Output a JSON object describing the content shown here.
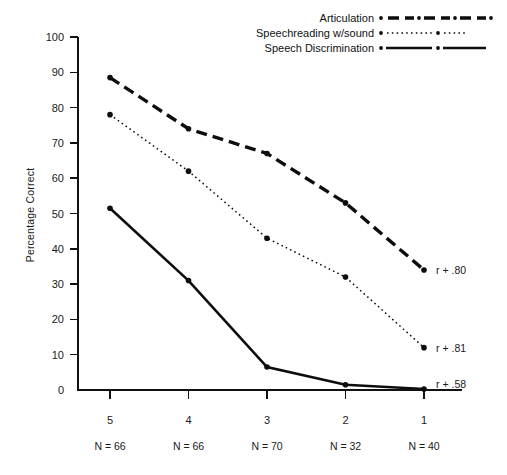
{
  "chart_data": {
    "type": "line",
    "title": "",
    "xlabel": "",
    "ylabel": "Percentage Correct",
    "categories": [
      "5",
      "4",
      "3",
      "2",
      "1"
    ],
    "category_sublabels": [
      "N = 66",
      "N = 66",
      "N = 70",
      "N = 32",
      "N = 40"
    ],
    "xlim": [
      5,
      1
    ],
    "ylim": [
      0,
      100
    ],
    "ytick_labels": [
      "0",
      "10",
      "20",
      "30",
      "40",
      "50",
      "60",
      "70",
      "80",
      "90",
      "100"
    ],
    "ytick_values": [
      0,
      10,
      20,
      30,
      40,
      50,
      60,
      70,
      80,
      90,
      100
    ],
    "grid": false,
    "legend_position": "top-right",
    "series": [
      {
        "name": "Articulation",
        "style": "dashed-thick",
        "values": [
          88.5,
          74,
          67,
          53,
          34
        ],
        "annotation": "r + .80"
      },
      {
        "name": "Speechreading w/sound",
        "style": "dotted",
        "values": [
          78,
          62,
          43,
          32,
          12
        ],
        "annotation": "r + .81"
      },
      {
        "name": "Speech Discrimination",
        "style": "solid",
        "values": [
          51.5,
          31,
          6.5,
          1.5,
          0.3
        ],
        "annotation": "r + .58"
      }
    ],
    "annotations": [
      {
        "text": "r + .80",
        "series": "Articulation"
      },
      {
        "text": "r + .81",
        "series": "Speechreading w/sound"
      },
      {
        "text": "r + .58",
        "series": "Speech Discrimination"
      }
    ],
    "colors": {
      "ink": "#0d0d0d",
      "axis": "#111111",
      "background": "#ffffff"
    }
  }
}
